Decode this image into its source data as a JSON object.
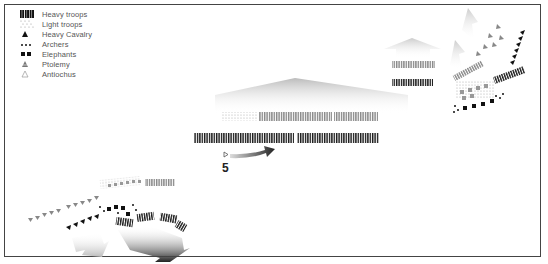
{
  "legend": {
    "items": [
      {
        "symbol": "heavy-troops-bars",
        "label": "Heavy troops"
      },
      {
        "symbol": "light-troops-dots",
        "label": "Light troops"
      },
      {
        "symbol": "heavy-cavalry-triangle",
        "label": "Heavy Cavalry"
      },
      {
        "symbol": "archers-dots",
        "label": "Archers"
      },
      {
        "symbol": "elephants-squares",
        "label": "Elephants"
      },
      {
        "symbol": "ptolemy-triangle",
        "label": "Ptolemy"
      },
      {
        "symbol": "antiochus-triangle",
        "label": "Antiochus"
      }
    ]
  },
  "diagram": {
    "phase_number": "5",
    "colors": {
      "heavy": "#1a1a1a",
      "light": "#999999",
      "arrow_dark": "#222222",
      "arrow_light": "#dddddd",
      "frame": "#444444"
    }
  }
}
